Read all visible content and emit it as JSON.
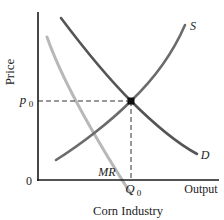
{
  "diagram": {
    "caption": "Corn Industry",
    "axes": {
      "y_label": "Price",
      "x_label": "Output",
      "origin_label": "0"
    },
    "equilibrium": {
      "price_label_base": "p",
      "price_label_sub": "0",
      "quantity_label_base": "Q",
      "quantity_label_sub": "0"
    },
    "curves": [
      {
        "id": "supply",
        "label": "S",
        "color": "#6b6b6b"
      },
      {
        "id": "demand",
        "label": "D",
        "color": "#555555"
      },
      {
        "id": "marginal-revenue",
        "label": "MR",
        "color": "#b8b8b8"
      }
    ],
    "colors": {
      "axis": "#1a1a1a",
      "dashed_guide": "#333333",
      "equilibrium_point": "#111111"
    }
  }
}
